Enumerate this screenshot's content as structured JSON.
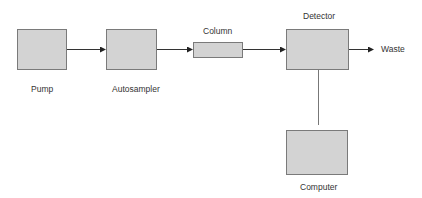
{
  "diagram": {
    "type": "block-flow",
    "colors": {
      "box_fill": "#d3d3d3",
      "box_border": "#7a7a7a",
      "line": "#333333",
      "text": "#333333"
    },
    "nodes": [
      {
        "id": "pump",
        "label": "Pump"
      },
      {
        "id": "autosampler",
        "label": "Autosampler"
      },
      {
        "id": "column",
        "label": "Column"
      },
      {
        "id": "detector",
        "label": "Detector"
      },
      {
        "id": "computer",
        "label": "Computer"
      }
    ],
    "terminal": {
      "id": "waste",
      "label": "Waste"
    },
    "edges": [
      {
        "from": "pump",
        "to": "autosampler",
        "arrow": true
      },
      {
        "from": "autosampler",
        "to": "column",
        "arrow": true
      },
      {
        "from": "column",
        "to": "detector",
        "arrow": true
      },
      {
        "from": "detector",
        "to": "waste",
        "arrow": true
      },
      {
        "from": "detector",
        "to": "computer",
        "arrow": false
      }
    ]
  }
}
